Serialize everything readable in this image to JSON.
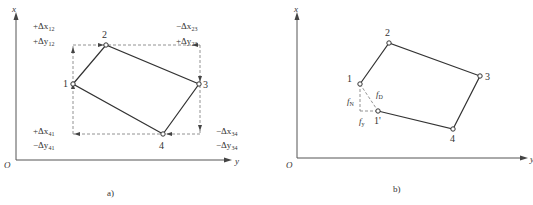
{
  "panel_a": {
    "caption": "a)",
    "axes": {
      "vertical": "x",
      "horizontal": "y",
      "origin": "O"
    },
    "points": [
      {
        "id": "1",
        "label": "1"
      },
      {
        "id": "2",
        "label": "2"
      },
      {
        "id": "3",
        "label": "3"
      },
      {
        "id": "4",
        "label": "4"
      }
    ],
    "increments": {
      "12": {
        "dx_sign": "+",
        "dx_sub": "12",
        "dy_sign": "+",
        "dy_sub": "12"
      },
      "23": {
        "dx_sign": "−",
        "dx_sub": "23",
        "dy_sign": "+",
        "dy_sub": "23"
      },
      "41": {
        "dx_sign": "+",
        "dx_sub": "41",
        "dy_sign": "−",
        "dy_sub": "41"
      },
      "34": {
        "dx_sign": "−",
        "dx_sub": "34",
        "dy_sign": "−",
        "dy_sub": "34"
      }
    },
    "delta_x": "Δx",
    "delta_y": "Δy"
  },
  "panel_b": {
    "caption": "b)",
    "axes": {
      "vertical": "x",
      "horizontal": "y",
      "origin": "O"
    },
    "points": [
      {
        "id": "1",
        "label": "1"
      },
      {
        "id": "2",
        "label": "2"
      },
      {
        "id": "3",
        "label": "3"
      },
      {
        "id": "4",
        "label": "4"
      },
      {
        "id": "1p",
        "label": "1'"
      }
    ],
    "errors": {
      "f_D": {
        "base": "f",
        "sub": "D"
      },
      "f_N": {
        "base": "f",
        "sub": "N"
      },
      "f_Y": {
        "base": "f",
        "sub": "y"
      }
    }
  }
}
